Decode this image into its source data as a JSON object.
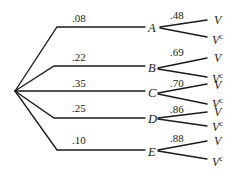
{
  "diagram": {
    "type": "probability-tree",
    "root": "start",
    "first_level": [
      {
        "node": "A",
        "prob": ".08",
        "second_level": [
          {
            "outcome": "V",
            "prob": ".48"
          },
          {
            "outcome": "V",
            "sup": "c"
          }
        ]
      },
      {
        "node": "B",
        "prob": ".22",
        "second_level": [
          {
            "outcome": "V",
            "prob": ".69"
          },
          {
            "outcome": "V",
            "sup": "c"
          }
        ]
      },
      {
        "node": "C",
        "prob": ".35",
        "second_level": [
          {
            "outcome": "V",
            "prob": ".70"
          },
          {
            "outcome": "V",
            "sup": "c"
          }
        ]
      },
      {
        "node": "D",
        "prob": ".25",
        "second_level": [
          {
            "outcome": "V",
            "prob": ".86"
          },
          {
            "outcome": "V",
            "sup": "c"
          }
        ]
      },
      {
        "node": "E",
        "prob": ".10",
        "second_level": [
          {
            "outcome": "V",
            "prob": ".88"
          },
          {
            "outcome": "V",
            "sup": "c"
          }
        ]
      }
    ]
  }
}
